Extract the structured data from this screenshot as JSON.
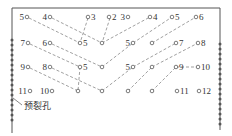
{
  "diagram": {
    "type": "blasting-hole-layout",
    "style": "V-cut (wedge) pattern with pre-split perimeter holes",
    "colors": {
      "line": "#555555",
      "text": "#333333",
      "background": "#ffffff"
    },
    "presplit_label": "预裂孔",
    "rows": [
      {
        "y": 17,
        "holes": [
          {
            "label": "5",
            "x": 27,
            "label_side": "left"
          },
          {
            "label": "4",
            "x": 50,
            "label_side": "left"
          },
          {
            "label": "3",
            "x": 88,
            "label_side": "right"
          },
          {
            "label": "2",
            "x": 109,
            "label_side": "right"
          },
          {
            "label": "3",
            "x": 128,
            "label_side": "left"
          },
          {
            "label": "4",
            "x": 150,
            "label_side": "right"
          },
          {
            "label": "5",
            "x": 172,
            "label_side": "right"
          },
          {
            "label": "6",
            "x": 196,
            "label_side": "right"
          }
        ]
      },
      {
        "y": 43,
        "holes": [
          {
            "label": "7",
            "x": 28,
            "label_side": "left"
          },
          {
            "label": "6",
            "x": 50,
            "label_side": "left"
          },
          {
            "label": "5",
            "x": 80,
            "label_side": "right"
          },
          {
            "label": "",
            "x": 102,
            "label_side": "none"
          },
          {
            "label": "5",
            "x": 133,
            "label_side": "left"
          },
          {
            "label": "",
            "x": 152,
            "label_side": "none"
          },
          {
            "label": "7",
            "x": 176,
            "label_side": "right"
          },
          {
            "label": "8",
            "x": 198,
            "label_side": "right"
          }
        ]
      },
      {
        "y": 67,
        "holes": [
          {
            "label": "9",
            "x": 28,
            "label_side": "left"
          },
          {
            "label": "8",
            "x": 50,
            "label_side": "left"
          },
          {
            "label": "5",
            "x": 80,
            "label_side": "right"
          },
          {
            "label": "",
            "x": 102,
            "label_side": "none"
          },
          {
            "label": "5",
            "x": 133,
            "label_side": "left"
          },
          {
            "label": "",
            "x": 152,
            "label_side": "none"
          },
          {
            "label": "9",
            "x": 176,
            "label_side": "right"
          },
          {
            "label": "10",
            "x": 198,
            "label_side": "right"
          }
        ]
      },
      {
        "y": 91,
        "holes": [
          {
            "label": "11",
            "x": 30,
            "label_side": "left"
          },
          {
            "label": "10",
            "x": 52,
            "label_side": "left"
          },
          {
            "label": "",
            "x": 78,
            "label_side": "none"
          },
          {
            "label": "",
            "x": 102,
            "label_side": "none"
          },
          {
            "label": "",
            "x": 128,
            "label_side": "none"
          },
          {
            "label": "",
            "x": 152,
            "label_side": "none"
          },
          {
            "label": "11",
            "x": 177,
            "label_side": "right"
          },
          {
            "label": "12",
            "x": 199,
            "label_side": "right"
          }
        ]
      }
    ]
  }
}
